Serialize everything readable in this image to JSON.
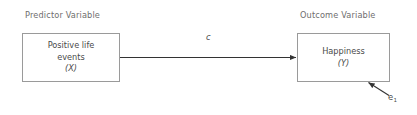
{
  "diagram": {
    "background_color": "#ffffff",
    "line_color": "#4a4a4a",
    "box_border_color": "#9a9a9a",
    "text_color": "#4a4a4a",
    "header_color": "#6e6e6e"
  },
  "headers": {
    "predictor": "Predictor Variable",
    "outcome": "Outcome Variable"
  },
  "nodes": {
    "predictor": {
      "line1": "Positive life",
      "line2": "events",
      "variable": "(X)"
    },
    "outcome": {
      "line1": "Happiness",
      "variable": "(Y)"
    }
  },
  "paths": {
    "direct": {
      "label": "c",
      "from": "predictor",
      "to": "outcome"
    }
  },
  "error": {
    "symbol": "e",
    "subscript": "1"
  }
}
